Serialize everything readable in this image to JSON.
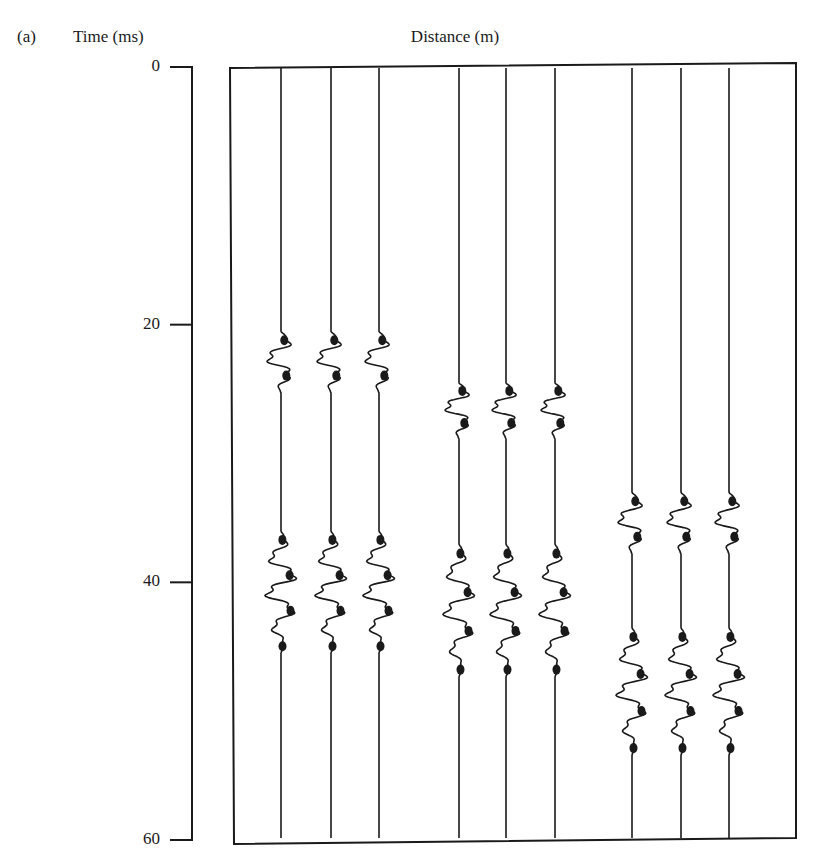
{
  "figure": {
    "panel_label": "(a)",
    "y_axis_title": "Time (ms)",
    "x_axis_title": "Distance (m)"
  },
  "chart_data": {
    "type": "seismic_wiggle_traces",
    "title": "",
    "panel": "(a)",
    "xlabel": "Distance (m)",
    "ylabel": "Time (ms)",
    "ylim": [
      0,
      60
    ],
    "y_inverted": true,
    "y_ticks": [
      0,
      20,
      40,
      60
    ],
    "grid": false,
    "legend": null,
    "trace_count": 9,
    "traces": [
      {
        "index": 1,
        "group": 1,
        "events_ms": [
          [
            20.5,
            26.0
          ],
          [
            36.0,
            47.0
          ]
        ]
      },
      {
        "index": 2,
        "group": 1,
        "events_ms": [
          [
            20.5,
            26.0
          ],
          [
            36.0,
            47.0
          ]
        ]
      },
      {
        "index": 3,
        "group": 1,
        "events_ms": [
          [
            20.5,
            26.0
          ],
          [
            36.0,
            47.0
          ]
        ]
      },
      {
        "index": 4,
        "group": 2,
        "events_ms": [
          [
            24.5,
            29.5
          ],
          [
            37.0,
            49.0
          ]
        ]
      },
      {
        "index": 5,
        "group": 2,
        "events_ms": [
          [
            24.5,
            29.5
          ],
          [
            37.0,
            49.0
          ]
        ]
      },
      {
        "index": 6,
        "group": 2,
        "events_ms": [
          [
            24.5,
            29.5
          ],
          [
            37.0,
            49.0
          ]
        ]
      },
      {
        "index": 7,
        "group": 3,
        "events_ms": [
          [
            33.0,
            38.5
          ],
          [
            43.5,
            55.0
          ]
        ]
      },
      {
        "index": 8,
        "group": 3,
        "events_ms": [
          [
            33.0,
            38.5
          ],
          [
            43.5,
            55.0
          ]
        ]
      },
      {
        "index": 9,
        "group": 3,
        "events_ms": [
          [
            33.0,
            38.5
          ],
          [
            43.5,
            55.0
          ]
        ]
      }
    ]
  },
  "layout": {
    "axis_x": 192,
    "tick_y": {
      "0": 67,
      "20": 325,
      "40": 582,
      "60": 840
    },
    "box": {
      "left": 230,
      "right": 796,
      "top": 65,
      "bottom": 842
    },
    "trace_x": [
      281,
      331,
      379,
      459,
      506,
      555,
      632,
      681,
      729
    ],
    "ink": "#1a1a1a"
  }
}
